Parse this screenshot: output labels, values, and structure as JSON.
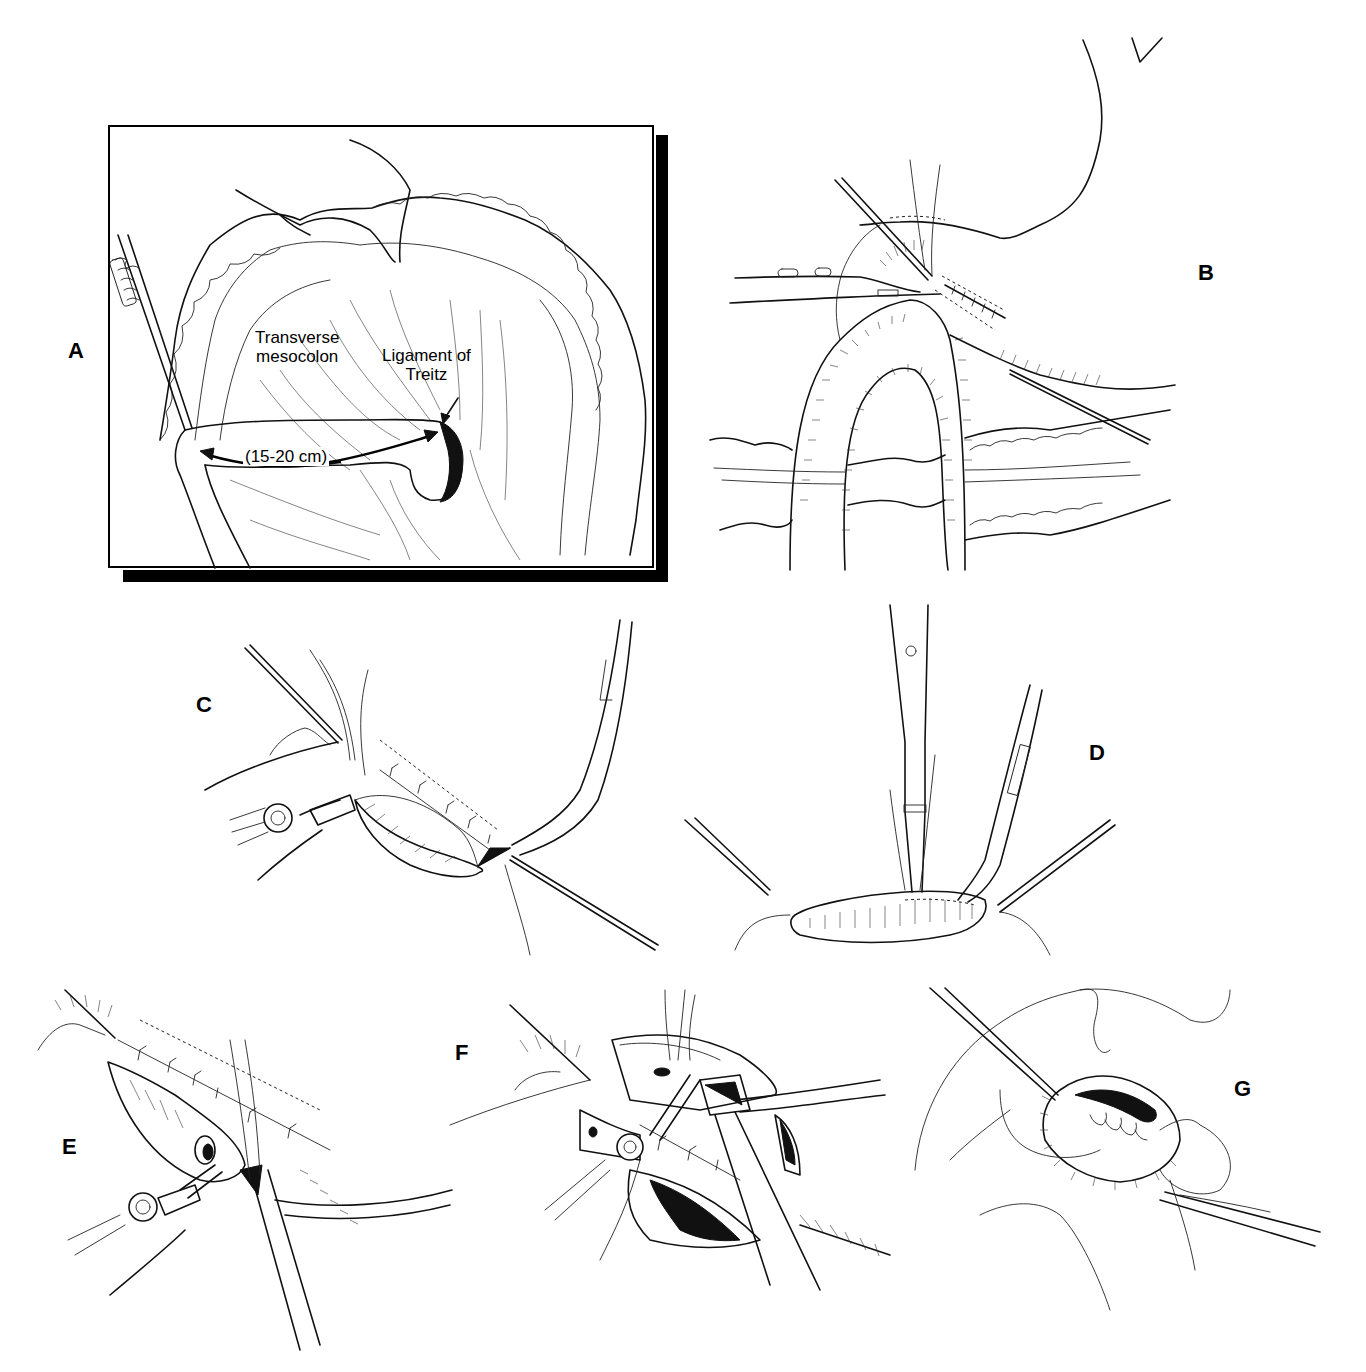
{
  "figure": {
    "type": "surgical-illustration",
    "panels": [
      {
        "id": "A",
        "label": "A",
        "annotations": {
          "mesocolon": "Transverse mesocolon",
          "ligament": "Ligament of Treitz",
          "measurement": "(15-20 cm)"
        },
        "framed": true
      },
      {
        "id": "B",
        "label": "B"
      },
      {
        "id": "C",
        "label": "C"
      },
      {
        "id": "D",
        "label": "D"
      },
      {
        "id": "E",
        "label": "E"
      },
      {
        "id": "F",
        "label": "F"
      },
      {
        "id": "G",
        "label": "G"
      }
    ]
  },
  "annotations": {
    "mesocolon_line1": "Transverse",
    "mesocolon_line2": "mesocolon",
    "ligament_line1": "Ligament of",
    "ligament_line2": "Treitz",
    "measurement": "(15-20 cm)"
  },
  "colors": {
    "ink": "#111111",
    "background": "#ffffff",
    "shadow": "#000000"
  }
}
